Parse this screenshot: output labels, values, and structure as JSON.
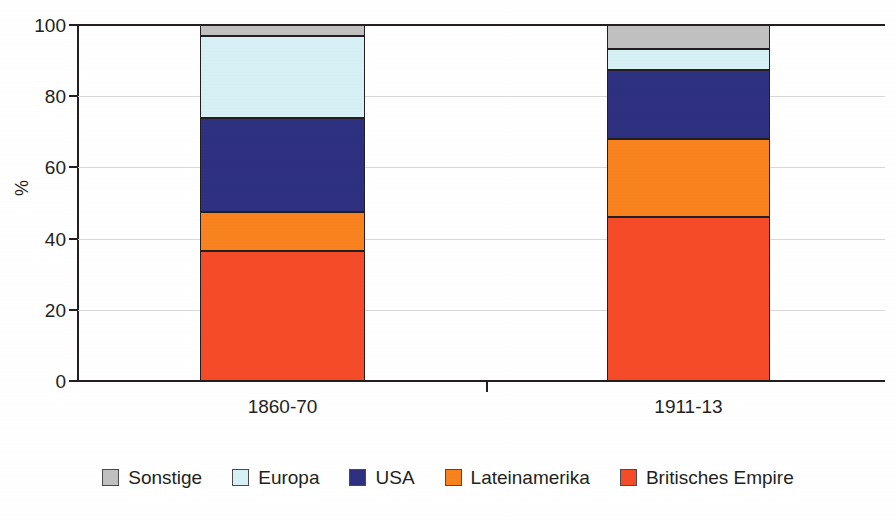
{
  "chart_data": {
    "type": "bar",
    "stacked": true,
    "title": "",
    "subtitle": "",
    "xlabel": "",
    "ylabel": "%",
    "ylim": [
      0,
      100
    ],
    "yticks": [
      0,
      20,
      40,
      60,
      80,
      100
    ],
    "ytick_labels": [
      "0",
      "20",
      "40",
      "60",
      "80",
      "100"
    ],
    "grid": true,
    "grid_axis": "y",
    "legend_position": "bottom",
    "categories": [
      "1860-70",
      "1911-13"
    ],
    "series": [
      {
        "name": "Britisches Empire",
        "color": "#F54B28",
        "values": [
          36.4,
          46.0
        ]
      },
      {
        "name": "Lateinamerika",
        "color": "#F8821E",
        "values": [
          11.0,
          22.0
        ]
      },
      {
        "name": "USA",
        "color": "#2E3080",
        "values": [
          26.6,
          19.3
        ]
      },
      {
        "name": "Europa",
        "color": "#D6F0F5",
        "values": [
          22.8,
          6.0
        ]
      },
      {
        "name": "Sonstige",
        "color": "#C0C0C0",
        "values": [
          3.2,
          6.7
        ]
      }
    ],
    "legend_order": [
      "Sonstige",
      "Europa",
      "USA",
      "Lateinamerika",
      "Britisches Empire"
    ],
    "annotations": []
  },
  "legend": {
    "items": [
      {
        "label": "Sonstige",
        "color": "#C0C0C0"
      },
      {
        "label": "Europa",
        "color": "#D6F0F5"
      },
      {
        "label": "USA",
        "color": "#2E3080"
      },
      {
        "label": "Lateinamerika",
        "color": "#F8821E"
      },
      {
        "label": "Britisches Empire",
        "color": "#F54B28"
      }
    ]
  },
  "axes": {
    "y_label": "%",
    "y_ticks": [
      "0",
      "20",
      "40",
      "60",
      "80",
      "100"
    ],
    "x_ticks": [
      "1860-70",
      "1911-13"
    ]
  }
}
